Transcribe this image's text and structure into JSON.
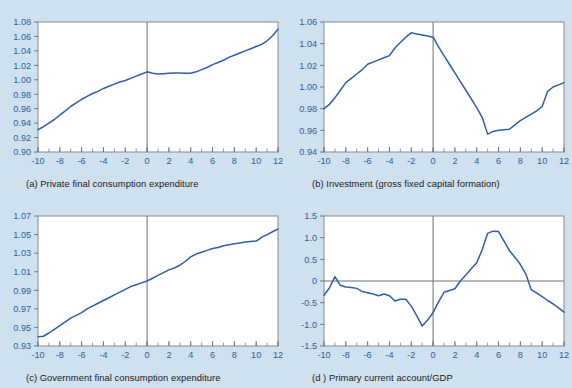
{
  "figure": {
    "background_color": "#cfe0ef",
    "plot_background_color": "#ffffff",
    "line_color": "#2f5ea8",
    "axis_color": "#6e6e6e",
    "tick_label_color": "#2d5f9e",
    "layout": "2x2 grid of line charts"
  },
  "panels": [
    {
      "id": "a",
      "label": "(a)",
      "caption": "(a) Private final consumption expenditure",
      "caption_text": "Private final consumption expenditure"
    },
    {
      "id": "b",
      "label": "(b)",
      "caption": "(b) Investment (gross fixed capital formation)",
      "caption_text": "Investment (gross fixed capital formation)"
    },
    {
      "id": "c",
      "label": "(c)",
      "caption": "(c) Government final consumption expenditure",
      "caption_text": "Government final consumption expenditure"
    },
    {
      "id": "d",
      "label": "(d )",
      "caption": "(d ) Primary current account/GDP",
      "caption_text": "Primary current account/GDP"
    }
  ],
  "chart_data": [
    {
      "type": "line",
      "id": "a",
      "title": "(a) Private final consumption expenditure",
      "xlabel": "",
      "ylabel": "",
      "xlim": [
        -10,
        12
      ],
      "ylim": [
        0.9,
        1.08
      ],
      "xticks": [
        -10,
        -8,
        -6,
        -4,
        -2,
        0,
        2,
        4,
        6,
        8,
        10,
        12
      ],
      "xtick_labels": [
        "-10",
        "-8",
        "-6",
        "-4",
        "-2",
        "0",
        "2",
        "4",
        "6",
        "8",
        "10",
        "12"
      ],
      "yticks": [
        0.9,
        0.92,
        0.94,
        0.96,
        0.98,
        1.0,
        1.02,
        1.04,
        1.06,
        1.08
      ],
      "ytick_labels": [
        "0.90",
        "0.92",
        "0.94",
        "0.96",
        "0.98",
        "1.00",
        "1.02",
        "1.04",
        "1.06",
        "1.08"
      ],
      "minor_xtick_step": 1,
      "grid": false,
      "legend": false,
      "zero_vline": true,
      "zero_hline": false,
      "x": [
        -10,
        -9.5,
        -9,
        -8.5,
        -8,
        -7.5,
        -7,
        -6.5,
        -6,
        -5.5,
        -5,
        -4.5,
        -4,
        -3.5,
        -3,
        -2.5,
        -2,
        -1.5,
        -1,
        -0.5,
        0,
        0.5,
        1,
        1.5,
        2,
        2.5,
        3,
        3.5,
        4,
        4.5,
        5,
        5.5,
        6,
        6.5,
        7,
        7.5,
        8,
        8.5,
        9,
        9.5,
        10,
        10.5,
        11,
        11.5,
        12
      ],
      "y": [
        0.931,
        0.935,
        0.94,
        0.945,
        0.951,
        0.957,
        0.963,
        0.968,
        0.973,
        0.977,
        0.981,
        0.984,
        0.988,
        0.991,
        0.994,
        0.997,
        0.999,
        1.002,
        1.005,
        1.008,
        1.011,
        1.009,
        1.008,
        1.0085,
        1.009,
        1.0095,
        1.0095,
        1.009,
        1.009,
        1.011,
        1.014,
        1.017,
        1.021,
        1.024,
        1.027,
        1.031,
        1.034,
        1.037,
        1.04,
        1.043,
        1.046,
        1.049,
        1.054,
        1.061,
        1.07
      ]
    },
    {
      "type": "line",
      "id": "b",
      "title": "(b) Investment (gross fixed capital formation)",
      "xlabel": "",
      "ylabel": "",
      "xlim": [
        -10,
        12
      ],
      "ylim": [
        0.94,
        1.06
      ],
      "xticks": [
        -10,
        -8,
        -6,
        -4,
        -2,
        0,
        2,
        4,
        6,
        8,
        10,
        12
      ],
      "xtick_labels": [
        "-10",
        "-8",
        "-6",
        "-4",
        "-2",
        "0",
        "2",
        "4",
        "6",
        "8",
        "10",
        "12"
      ],
      "yticks": [
        0.94,
        0.96,
        0.98,
        1.0,
        1.02,
        1.04,
        1.06
      ],
      "ytick_labels": [
        "0.94",
        "0.96",
        "0.98",
        "1.00",
        "1.02",
        "1.04",
        "1.06"
      ],
      "minor_xtick_step": 1,
      "grid": false,
      "legend": false,
      "zero_vline": true,
      "zero_hline": false,
      "x": [
        -10,
        -9.5,
        -9,
        -8.5,
        -8,
        -7.5,
        -7,
        -6.5,
        -6,
        -5.5,
        -5,
        -4.5,
        -4,
        -3.5,
        -3,
        -2.5,
        -2,
        -1.5,
        -1,
        -0.5,
        0,
        0.5,
        1,
        1.5,
        2,
        2.5,
        3,
        3.5,
        4,
        4.5,
        5,
        5.5,
        6,
        6.5,
        7,
        7.5,
        8,
        8.5,
        9,
        9.5,
        10,
        10.5,
        11,
        11.5,
        12
      ],
      "y": [
        0.98,
        0.984,
        0.99,
        0.997,
        1.004,
        1.008,
        1.012,
        1.016,
        1.021,
        1.023,
        1.025,
        1.027,
        1.029,
        1.036,
        1.041,
        1.046,
        1.05,
        1.049,
        1.048,
        1.047,
        1.046,
        1.037,
        1.029,
        1.021,
        1.013,
        1.005,
        0.997,
        0.989,
        0.981,
        0.972,
        0.9565,
        0.959,
        0.96,
        0.9605,
        0.961,
        0.965,
        0.969,
        0.972,
        0.975,
        0.978,
        0.982,
        0.996,
        1.0,
        1.002,
        1.004
      ]
    },
    {
      "type": "line",
      "id": "c",
      "title": "(c) Government final consumption expenditure",
      "xlabel": "",
      "ylabel": "",
      "xlim": [
        -10,
        12
      ],
      "ylim": [
        0.93,
        1.07
      ],
      "xticks": [
        -10,
        -8,
        -6,
        -4,
        -2,
        0,
        2,
        4,
        6,
        8,
        10,
        12
      ],
      "xtick_labels": [
        "-10",
        "-8",
        "-6",
        "-4",
        "-2",
        "0",
        "2",
        "4",
        "6",
        "8",
        "10",
        "12"
      ],
      "yticks": [
        0.93,
        0.95,
        0.97,
        0.99,
        1.01,
        1.03,
        1.05,
        1.07
      ],
      "ytick_labels": [
        "0.93",
        "0.95",
        "0.97",
        "0.99",
        "1.01",
        "1.03",
        "1.05",
        "1.07"
      ],
      "minor_xtick_step": 1,
      "grid": false,
      "legend": false,
      "zero_vline": true,
      "zero_hline": false,
      "x": [
        -10,
        -9.5,
        -9,
        -8.5,
        -8,
        -7.5,
        -7,
        -6.5,
        -6,
        -5.5,
        -5,
        -4.5,
        -4,
        -3.5,
        -3,
        -2.5,
        -2,
        -1.5,
        -1,
        -0.5,
        0,
        0.5,
        1,
        1.5,
        2,
        2.5,
        3,
        3.5,
        4,
        4.5,
        5,
        5.5,
        6,
        6.5,
        7,
        7.5,
        8,
        8.5,
        9,
        9.5,
        10,
        10.5,
        11,
        11.5,
        12
      ],
      "y": [
        0.94,
        0.9405,
        0.944,
        0.948,
        0.952,
        0.956,
        0.96,
        0.963,
        0.966,
        0.97,
        0.973,
        0.976,
        0.979,
        0.982,
        0.985,
        0.988,
        0.991,
        0.994,
        0.996,
        0.998,
        1.0,
        1.003,
        1.006,
        1.009,
        1.012,
        1.014,
        1.017,
        1.021,
        1.026,
        1.029,
        1.031,
        1.033,
        1.035,
        1.036,
        1.038,
        1.039,
        1.04,
        1.041,
        1.042,
        1.0425,
        1.043,
        1.047,
        1.05,
        1.053,
        1.056
      ]
    },
    {
      "type": "line",
      "id": "d",
      "title": "(d ) Primary current account/GDP",
      "xlabel": "",
      "ylabel": "",
      "xlim": [
        -10,
        12
      ],
      "ylim": [
        -1.5,
        1.5
      ],
      "xticks": [
        -10,
        -8,
        -6,
        -4,
        -2,
        0,
        2,
        4,
        6,
        8,
        10,
        12
      ],
      "xtick_labels": [
        "-10",
        "-8",
        "-6",
        "-4",
        "-2",
        "0",
        "2",
        "4",
        "6",
        "8",
        "10",
        "12"
      ],
      "yticks": [
        -1.5,
        -1.0,
        -0.5,
        0,
        0.5,
        1.0,
        1.5
      ],
      "ytick_labels": [
        "-1.5",
        "-1.0",
        "-0.5",
        "0",
        "0.5",
        "1.0",
        "1.5"
      ],
      "minor_xtick_step": 1,
      "grid": false,
      "legend": false,
      "zero_vline": true,
      "zero_hline": true,
      "x": [
        -10,
        -9.5,
        -9,
        -8.5,
        -8,
        -7.5,
        -7,
        -6.5,
        -6,
        -5.5,
        -5,
        -4.5,
        -4,
        -3.5,
        -3,
        -2.5,
        -2,
        -1.5,
        -1,
        -0.5,
        0,
        0.5,
        1,
        1.5,
        2,
        2.5,
        3,
        3.5,
        4,
        4.5,
        5,
        5.5,
        6,
        6.5,
        7,
        7.5,
        8,
        8.5,
        9,
        9.5,
        10,
        10.5,
        11,
        11.5,
        12
      ],
      "y": [
        -0.33,
        -0.16,
        0.1,
        -0.1,
        -0.14,
        -0.15,
        -0.17,
        -0.24,
        -0.27,
        -0.3,
        -0.34,
        -0.3,
        -0.34,
        -0.46,
        -0.42,
        -0.42,
        -0.58,
        -0.8,
        -1.04,
        -0.9,
        -0.73,
        -0.48,
        -0.26,
        -0.22,
        -0.18,
        0.0,
        0.14,
        0.28,
        0.42,
        0.72,
        1.1,
        1.15,
        1.14,
        0.92,
        0.7,
        0.55,
        0.38,
        0.16,
        -0.2,
        -0.28,
        -0.36,
        -0.45,
        -0.53,
        -0.62,
        -0.72
      ]
    }
  ]
}
